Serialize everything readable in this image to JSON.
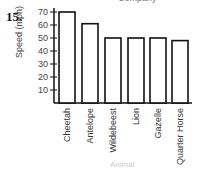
{
  "question_number": "15.",
  "top_title_fragment": "Company",
  "bottom_faint_text": "Animal",
  "chart_data": {
    "type": "bar",
    "title": "",
    "xlabel": "",
    "ylabel": "Speed (mph)",
    "categories": [
      "Cheetah",
      "Antelope",
      "Wildebeest",
      "Lion",
      "Gazelle",
      "Quarter Horse"
    ],
    "values": [
      70,
      61,
      50,
      50,
      50,
      48
    ],
    "yticks": [
      10,
      20,
      30,
      40,
      50,
      60,
      70
    ],
    "ylim": [
      0,
      75
    ],
    "grid": false,
    "legend": null,
    "bar_fill": "#ffffff",
    "bar_stroke": "#111111"
  }
}
